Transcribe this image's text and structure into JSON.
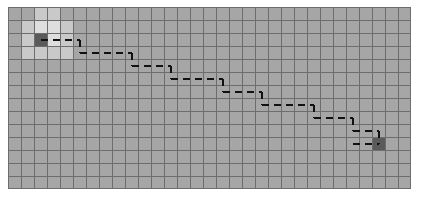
{
  "canvas": {
    "width": 425,
    "height": 202,
    "background": "#ffffff"
  },
  "grid": {
    "origin_x": 8,
    "origin_y": 7,
    "cell_size": 13,
    "columns": 31,
    "rows": 14,
    "line_width": 1,
    "colors": {
      "cell_fill": "#a6a6a6",
      "grid_line": "#6d6d6d",
      "border": "#6d6d6d",
      "explored_fill": "#c9c9c9",
      "explored_bright_fill": "#dedede",
      "start_fill": "#5a5a5a",
      "goal_fill": "#5a5a5a",
      "path_stroke": "#111111"
    }
  },
  "markers": {
    "start": {
      "col": 2,
      "row": 2,
      "label": "start-cell"
    },
    "goal": {
      "col": 28,
      "row": 10,
      "label": "goal-cell"
    }
  },
  "explored_cells": [
    {
      "col": 1,
      "row": 1,
      "shade": "explored"
    },
    {
      "col": 2,
      "row": 1,
      "shade": "explored_bright"
    },
    {
      "col": 3,
      "row": 1,
      "shade": "explored_bright"
    },
    {
      "col": 4,
      "row": 1,
      "shade": "explored"
    },
    {
      "col": 1,
      "row": 2,
      "shade": "explored"
    },
    {
      "col": 3,
      "row": 2,
      "shade": "explored_bright"
    },
    {
      "col": 4,
      "row": 2,
      "shade": "explored"
    },
    {
      "col": 1,
      "row": 3,
      "shade": "explored"
    },
    {
      "col": 2,
      "row": 3,
      "shade": "explored"
    },
    {
      "col": 3,
      "row": 3,
      "shade": "explored"
    },
    {
      "col": 4,
      "row": 3,
      "shade": "explored"
    },
    {
      "col": 2,
      "row": 0,
      "shade": "explored"
    },
    {
      "col": 3,
      "row": 0,
      "shade": "explored"
    }
  ],
  "path": {
    "type": "dashed-staircase",
    "dash_length": 7,
    "dash_gap": 5,
    "stroke_width": 2,
    "segments": [
      {
        "orient": "h",
        "col_start": 2,
        "col_end": 5,
        "row": 2
      },
      {
        "orient": "v",
        "col": 5,
        "row_start": 2,
        "row_end": 3
      },
      {
        "orient": "h",
        "col_start": 5,
        "col_end": 9,
        "row": 3
      },
      {
        "orient": "v",
        "col": 9,
        "row_start": 3,
        "row_end": 4
      },
      {
        "orient": "h",
        "col_start": 9,
        "col_end": 12,
        "row": 4
      },
      {
        "orient": "v",
        "col": 12,
        "row_start": 4,
        "row_end": 5
      },
      {
        "orient": "h",
        "col_start": 12,
        "col_end": 16,
        "row": 5
      },
      {
        "orient": "v",
        "col": 16,
        "row_start": 5,
        "row_end": 6
      },
      {
        "orient": "h",
        "col_start": 16,
        "col_end": 19,
        "row": 6
      },
      {
        "orient": "v",
        "col": 19,
        "row_start": 6,
        "row_end": 7
      },
      {
        "orient": "h",
        "col_start": 19,
        "col_end": 23,
        "row": 7
      },
      {
        "orient": "v",
        "col": 23,
        "row_start": 7,
        "row_end": 8
      },
      {
        "orient": "h",
        "col_start": 23,
        "col_end": 26,
        "row": 8
      },
      {
        "orient": "v",
        "col": 26,
        "row_start": 8,
        "row_end": 9
      },
      {
        "orient": "h",
        "col_start": 26,
        "col_end": 28,
        "row": 9
      },
      {
        "orient": "v",
        "col": 28,
        "row_start": 9,
        "row_end": 10
      },
      {
        "orient": "h",
        "col_start": 26,
        "col_end": 28,
        "row": 10
      }
    ]
  }
}
